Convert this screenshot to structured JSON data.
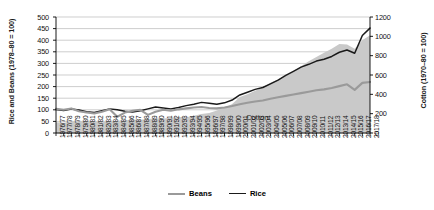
{
  "chart_data": {
    "type": "line",
    "title": "",
    "xlabel": "",
    "ylabel": "Rice and Beans (1978–80 = 100)",
    "y2label": "Cotton (1970–80 = 100)",
    "ylim": [
      0,
      500
    ],
    "y2lim": [
      0,
      1200
    ],
    "yticks": [
      0,
      50,
      100,
      150,
      200,
      250,
      300,
      350,
      400,
      450,
      500
    ],
    "y2ticks": [
      0,
      200,
      400,
      600,
      800,
      1000,
      1200
    ],
    "grid": true,
    "legend_position": "bottom-center",
    "annotations": [
      {
        "text": "Cotton",
        "series": "Cotton",
        "x": "2005/06",
        "axis": "right"
      }
    ],
    "categories": [
      "1976/77",
      "1977/78",
      "1978/79",
      "1979/80",
      "1980/81",
      "1981/82",
      "1982/83",
      "1983/84",
      "1984/85",
      "1985/86",
      "1986/87",
      "1987/88",
      "1988/89",
      "1989/90",
      "1990/91",
      "1991/92",
      "1992/93",
      "1993/94",
      "1994/95",
      "1995/96",
      "1996/97",
      "1997/98",
      "1998/99",
      "1999/00",
      "2000/01",
      "2001/02",
      "2002/03",
      "2003/04",
      "2004/05",
      "2005/06",
      "2006/07",
      "2007/08",
      "2008/09",
      "2009/10",
      "2010/11",
      "2011/12",
      "2012/13",
      "2013/14",
      "2014/15",
      "2015/16",
      "2016/17",
      "2017/18"
    ],
    "series": [
      {
        "name": "Cotton",
        "axis": "right",
        "style": "area",
        "color": "#c9c9c9",
        "values": [
          110,
          105,
          118,
          122,
          128,
          120,
          112,
          118,
          126,
          132,
          140,
          138,
          146,
          152,
          150,
          158,
          166,
          162,
          178,
          196,
          208,
          232,
          262,
          300,
          372,
          402,
          436,
          470,
          520,
          556,
          596,
          640,
          690,
          742,
          786,
          830,
          872,
          920,
          916,
          872,
          960,
          1012
        ]
      },
      {
        "name": "Rice",
        "axis": "left",
        "style": "line",
        "color": "#1a1a1a",
        "values": [
          101,
          97,
          103,
          99,
          92,
          88,
          96,
          104,
          100,
          94,
          90,
          96,
          104,
          112,
          108,
          104,
          110,
          118,
          124,
          132,
          128,
          124,
          130,
          142,
          164,
          176,
          188,
          196,
          212,
          228,
          248,
          266,
          284,
          296,
          310,
          318,
          330,
          348,
          358,
          344,
          420,
          452
        ]
      },
      {
        "name": "Beans",
        "axis": "left",
        "style": "line",
        "color": "#9a9a9a",
        "values": [
          104,
          100,
          106,
          94,
          88,
          84,
          92,
          102,
          70,
          88,
          96,
          100,
          78,
          92,
          100,
          96,
          102,
          106,
          110,
          112,
          108,
          106,
          110,
          116,
          124,
          130,
          136,
          140,
          148,
          154,
          160,
          166,
          172,
          178,
          184,
          188,
          194,
          202,
          210,
          186,
          216,
          220
        ]
      }
    ]
  },
  "legend": {
    "items": [
      {
        "label": "Beans",
        "color": "#9a9a9a"
      },
      {
        "label": "Rice",
        "color": "#1a1a1a"
      }
    ]
  }
}
